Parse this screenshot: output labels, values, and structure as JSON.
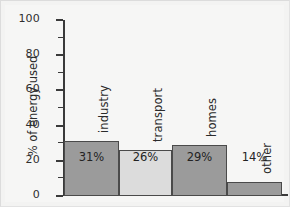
{
  "chart_data": {
    "type": "bar",
    "title": "",
    "xlabel": "",
    "ylabel": "% of energy used",
    "ylim": [
      0,
      100
    ],
    "ytick_labels": [
      "0",
      "20",
      "40",
      "60",
      "80",
      "100"
    ],
    "ytick_values": [
      0,
      20,
      40,
      60,
      80,
      100
    ],
    "minor_tick_interval": 10,
    "grid": false,
    "legend": "none",
    "categories": [
      "industry",
      "transport",
      "homes",
      "other"
    ],
    "values": [
      31,
      26,
      29,
      14
    ],
    "value_labels": [
      "31%",
      "26%",
      "29%",
      "14%"
    ],
    "bars": [
      {
        "category": "industry",
        "value": 31,
        "value_label": "31%",
        "plotted_height": 31,
        "color": "#9b9b9b"
      },
      {
        "category": "transport",
        "value": 26,
        "value_label": "26%",
        "plotted_height": 26,
        "color": "#dcdcdc"
      },
      {
        "category": "homes",
        "value": 29,
        "value_label": "29%",
        "plotted_height": 29,
        "color": "#9b9b9b"
      },
      {
        "category": "other",
        "value": 14,
        "value_label": "14%",
        "plotted_height": 8,
        "color": "#9b9b9b"
      }
    ],
    "colors": {
      "bar_dark": "#9b9b9b",
      "bar_light": "#dcdcdc",
      "axis": "#3a3a3a",
      "text": "#2b2b2b",
      "background": "#f6f6f5"
    }
  }
}
